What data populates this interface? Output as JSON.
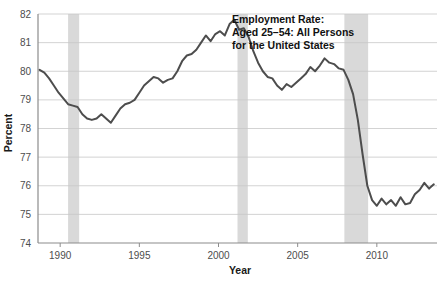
{
  "chart_data": {
    "type": "line",
    "title_lines": [
      "Employment Rate:",
      "Aged 25–54: All Persons",
      "for the United States"
    ],
    "xlabel": "Year",
    "ylabel": "Percent",
    "xlim": [
      1988.6,
      2013.8
    ],
    "ylim": [
      74,
      82
    ],
    "xticks": [
      1990,
      1995,
      2000,
      2005,
      2010
    ],
    "xtick_labels": [
      "1990",
      "1995",
      "2000",
      "2005",
      "2010"
    ],
    "yticks": [
      74,
      75,
      76,
      77,
      78,
      79,
      80,
      81,
      82
    ],
    "ytick_labels": [
      "74",
      "75",
      "76",
      "77",
      "78",
      "79",
      "80",
      "81",
      "82"
    ],
    "grid": true,
    "legend": "none",
    "line_color": "#4d4d4d",
    "grid_color": "#c8c8c8",
    "axis_color": "#8c8c8c",
    "recession_band_color": "#d9d9d9",
    "recession_bands": [
      {
        "start": 1990.5,
        "end": 1991.2
      },
      {
        "start": 2001.2,
        "end": 2001.85
      },
      {
        "start": 2007.95,
        "end": 2009.45
      }
    ],
    "series": [
      {
        "name": "Employment Rate: Aged 25-54: All Persons for the United States",
        "x": [
          1988.7,
          1989.0,
          1989.3,
          1989.6,
          1989.9,
          1990.2,
          1990.5,
          1990.8,
          1991.1,
          1991.4,
          1991.7,
          1992.0,
          1992.3,
          1992.6,
          1992.9,
          1993.2,
          1993.5,
          1993.8,
          1994.1,
          1994.4,
          1994.7,
          1995.0,
          1995.3,
          1995.6,
          1995.9,
          1996.2,
          1996.5,
          1996.8,
          1997.1,
          1997.4,
          1997.7,
          1998.0,
          1998.3,
          1998.6,
          1998.9,
          1999.2,
          1999.5,
          1999.8,
          2000.1,
          2000.4,
          2000.7,
          2001.0,
          2001.3,
          2001.6,
          2001.9,
          2002.2,
          2002.5,
          2002.8,
          2003.1,
          2003.4,
          2003.7,
          2004.0,
          2004.3,
          2004.6,
          2004.9,
          2005.2,
          2005.5,
          2005.8,
          2006.1,
          2006.4,
          2006.7,
          2007.0,
          2007.3,
          2007.6,
          2007.9,
          2008.2,
          2008.5,
          2008.8,
          2009.1,
          2009.4,
          2009.7,
          2010.0,
          2010.3,
          2010.6,
          2010.9,
          2011.2,
          2011.5,
          2011.8,
          2012.1,
          2012.4,
          2012.7,
          2013.0,
          2013.3,
          2013.6
        ],
        "y": [
          80.05,
          79.95,
          79.75,
          79.5,
          79.25,
          79.05,
          78.85,
          78.8,
          78.75,
          78.5,
          78.35,
          78.3,
          78.35,
          78.5,
          78.35,
          78.2,
          78.45,
          78.7,
          78.85,
          78.9,
          79.0,
          79.25,
          79.5,
          79.65,
          79.8,
          79.75,
          79.6,
          79.7,
          79.75,
          80.0,
          80.35,
          80.55,
          80.6,
          80.75,
          81.0,
          81.25,
          81.05,
          81.3,
          81.4,
          81.25,
          81.65,
          81.8,
          81.45,
          81.5,
          81.2,
          80.7,
          80.3,
          80.0,
          79.8,
          79.75,
          79.5,
          79.35,
          79.55,
          79.45,
          79.6,
          79.75,
          79.9,
          80.15,
          80.0,
          80.2,
          80.45,
          80.3,
          80.25,
          80.1,
          80.05,
          79.7,
          79.2,
          78.3,
          77.1,
          76.0,
          75.5,
          75.3,
          75.55,
          75.35,
          75.5,
          75.3,
          75.6,
          75.35,
          75.4,
          75.7,
          75.85,
          76.1,
          75.9,
          76.05
        ]
      }
    ]
  }
}
